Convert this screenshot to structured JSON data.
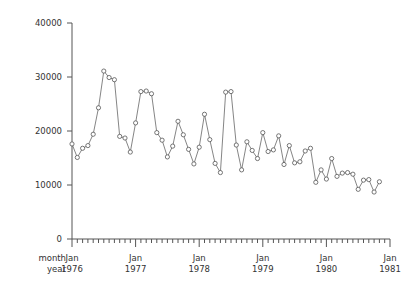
{
  "chart_data": {
    "type": "line",
    "title": "",
    "xlabel": "",
    "ylabel": "",
    "grid": false,
    "legend": "none",
    "marker": "open-circle",
    "ylim": [
      0,
      40000
    ],
    "y_ticks": [
      0,
      10000,
      20000,
      30000,
      40000
    ],
    "y_tick_labels": [
      "0",
      "10000",
      "20000",
      "30000",
      "40000"
    ],
    "x_axis_captions": [
      "month",
      "year"
    ],
    "x_tick_group_labels": [
      {
        "month": "Jan",
        "year": "1976"
      },
      {
        "month": "Jan",
        "year": "1977"
      },
      {
        "month": "Jan",
        "year": "1978"
      },
      {
        "month": "Jan",
        "year": "1979"
      },
      {
        "month": "Jan",
        "year": "1980"
      },
      {
        "month": "Jan",
        "year": "1981"
      }
    ],
    "x_minor_ticks_per_year": 12,
    "x_range_months": [
      0,
      60
    ],
    "x": [
      "1976-01",
      "1976-02",
      "1976-03",
      "1976-04",
      "1976-05",
      "1976-06",
      "1976-07",
      "1976-08",
      "1976-09",
      "1976-10",
      "1976-11",
      "1976-12",
      "1977-01",
      "1977-02",
      "1977-03",
      "1977-04",
      "1977-05",
      "1977-06",
      "1977-07",
      "1977-08",
      "1977-09",
      "1977-10",
      "1977-11",
      "1977-12",
      "1978-01",
      "1978-02",
      "1978-03",
      "1978-04",
      "1978-05",
      "1978-06",
      "1978-07",
      "1978-08",
      "1978-09",
      "1978-10",
      "1978-11",
      "1978-12",
      "1979-01",
      "1979-02",
      "1979-03",
      "1979-04",
      "1979-05",
      "1979-06",
      "1979-07",
      "1979-08",
      "1979-09",
      "1979-10",
      "1979-11",
      "1979-12",
      "1980-01",
      "1980-02",
      "1980-03",
      "1980-04",
      "1980-05",
      "1980-06",
      "1980-07",
      "1980-08",
      "1980-09",
      "1980-10",
      "1980-11"
    ],
    "values": [
      17600,
      15100,
      16800,
      17300,
      19400,
      24300,
      31100,
      29900,
      29500,
      19000,
      18700,
      16100,
      21500,
      27300,
      27400,
      26900,
      19700,
      18300,
      15200,
      17200,
      21800,
      19300,
      16600,
      13900,
      17000,
      23100,
      18400,
      14000,
      12300,
      27200,
      27300,
      17400,
      12800,
      18000,
      16400,
      14900,
      19700,
      16200,
      16500,
      19100,
      13800,
      17300,
      14100,
      14300,
      16300,
      16800,
      10500,
      12800,
      11100,
      14900,
      11600,
      12200,
      12300,
      12000,
      9200,
      10900,
      11000,
      8700,
      10600
    ],
    "series_name": "monthly series"
  }
}
